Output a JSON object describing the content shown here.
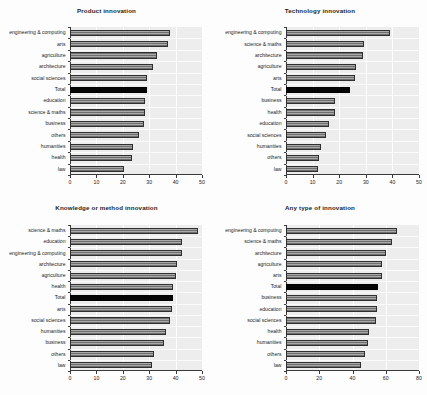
{
  "figure": {
    "background_color": "#fdfdfd",
    "plot_background_color": "#ededed",
    "bar_color": "#8c8c8c",
    "total_bar_color": "#050505",
    "axis_color": "#3a3a3a"
  },
  "chart_data": [
    {
      "type": "bar",
      "orientation": "horizontal",
      "title": "Product innovation",
      "xlabel": "",
      "ylabel": "",
      "xlim": [
        0,
        50
      ],
      "xticks": [
        0,
        10,
        20,
        30,
        40,
        50
      ],
      "grid": true,
      "legend": "none",
      "highlight_category": "Total",
      "categories": [
        "engineering & computing",
        "arts",
        "agriculture",
        "architecture",
        "social sciences",
        "Total",
        "education",
        "science & maths",
        "business",
        "others",
        "humanities",
        "health",
        "law"
      ],
      "values": [
        38,
        37,
        33,
        31.5,
        29,
        29,
        28.5,
        28.5,
        28,
        26,
        24,
        23.5,
        20.5
      ]
    },
    {
      "type": "bar",
      "orientation": "horizontal",
      "title": "Technology innovation",
      "xlabel": "",
      "ylabel": "",
      "xlim": [
        0,
        50
      ],
      "xticks": [
        0,
        10,
        20,
        30,
        40,
        50
      ],
      "grid": true,
      "legend": "none",
      "highlight_category": "Total",
      "categories": [
        "engineering & computing",
        "science & maths",
        "architecture",
        "agriculture",
        "arts",
        "Total",
        "business",
        "health",
        "education",
        "social sciences",
        "humanities",
        "others",
        "law"
      ],
      "values": [
        39,
        29.5,
        29,
        26.5,
        26,
        24,
        18.5,
        18.5,
        16,
        15,
        13,
        12.5,
        12
      ]
    },
    {
      "type": "bar",
      "orientation": "horizontal",
      "title": "Knowledge or method innovation",
      "xlabel": "",
      "ylabel": "",
      "xlim": [
        0,
        50
      ],
      "xticks": [
        0,
        10,
        20,
        30,
        40,
        50
      ],
      "grid": true,
      "legend": "none",
      "highlight_category": "Total",
      "categories": [
        "science & maths",
        "education",
        "engineering & computing",
        "architecture",
        "agriculture",
        "health",
        "Total",
        "arts",
        "social sciences",
        "humanities",
        "business",
        "others",
        "law"
      ],
      "values": [
        48.5,
        42.5,
        42.5,
        40.5,
        40,
        39,
        39,
        38.5,
        38,
        36.5,
        35.5,
        32,
        31
      ]
    },
    {
      "type": "bar",
      "orientation": "horizontal",
      "title": "Any type of innovation",
      "xlabel": "",
      "ylabel": "",
      "xlim": [
        0,
        80
      ],
      "xticks": [
        0,
        20,
        40,
        60,
        80
      ],
      "grid": true,
      "legend": "none",
      "highlight_category": "Total",
      "categories": [
        "engineering & computing",
        "science & maths",
        "architecture",
        "agriculture",
        "arts",
        "Total",
        "business",
        "education",
        "social sciences",
        "health",
        "humanities",
        "others",
        "law"
      ],
      "values": [
        66.5,
        64,
        60,
        58,
        57.5,
        55.5,
        55,
        54.5,
        54,
        50,
        49.5,
        47.5,
        45
      ]
    }
  ]
}
